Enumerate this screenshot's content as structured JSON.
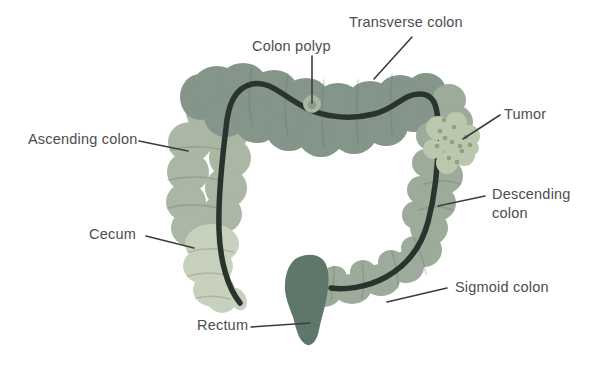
{
  "diagram": {
    "name": "Large intestine (colon) anatomy with polyp and tumor",
    "background": "#ffffff",
    "labels": {
      "transverse_colon": "Transverse colon",
      "colon_polyp": "Colon polyp",
      "tumor": "Tumor",
      "ascending_colon": "Ascending colon",
      "descending_colon": "Descending colon",
      "cecum": "Cecum",
      "sigmoid_colon": "Sigmoid colon",
      "rectum": "Rectum"
    },
    "colors": {
      "transverse": "#84958a",
      "ascending": "#a9b7a4",
      "cecum": "#c8d1bd",
      "descending_sigmoid": "#9dab9a",
      "rectum": "#5e776a",
      "taenia_line": "#29342f",
      "crease": "#5f7264",
      "tumor": "#bcc8ad",
      "tumor_dots": "#8da083",
      "polyp_outer": "#aab8a3",
      "polyp_inner": "#8c9d85",
      "label_text": "#4d4d4d",
      "leader_line": "#3d3d3d"
    }
  }
}
